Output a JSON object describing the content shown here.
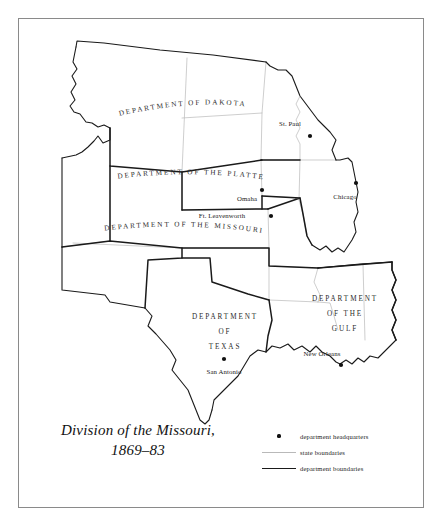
{
  "figure": {
    "title_lines": [
      "Division of the Missouri,",
      "1869–83"
    ],
    "frame_color": "#8a8a8a",
    "background": "#ffffff"
  },
  "map": {
    "departments": [
      {
        "id": "dakota",
        "label_lines": [
          "DEPARTMENT",
          "OF  DAKOTA"
        ],
        "full_name": "DEPARTMENT OF DAKOTA",
        "layout": "arc-single-line"
      },
      {
        "id": "platte",
        "label_lines": [
          "DEPARTMENT",
          "OF  THE  PLATTE"
        ],
        "full_name": "DEPARTMENT OF THE PLATTE",
        "layout": "arc-single-line"
      },
      {
        "id": "missouri",
        "label_lines": [
          "DEPARTMENT",
          "OF  THE  MISSOURI"
        ],
        "full_name": "DEPARTMENT OF THE MISSOURI",
        "layout": "arc-single-line"
      },
      {
        "id": "texas",
        "label_lines": [
          "DEPARTMENT",
          "OF",
          "TEXAS"
        ],
        "full_name": "DEPARTMENT OF TEXAS",
        "layout": "stacked-centered"
      },
      {
        "id": "gulf",
        "label_lines": [
          "DEPARTMENT",
          "OF THE",
          "GULF"
        ],
        "full_name": "DEPARTMENT OF THE GULF",
        "layout": "stacked-centered"
      }
    ],
    "headquarters": [
      {
        "id": "st-paul",
        "name": "St. Paul",
        "label_x": 290,
        "label_y": 126,
        "dot_x": 310,
        "dot_y": 136
      },
      {
        "id": "chicago",
        "name": "Chicago",
        "label_x": 345,
        "label_y": 199,
        "dot_x": 356,
        "dot_y": 183
      },
      {
        "id": "omaha",
        "name": "Omaha",
        "label_x": 248,
        "label_y": 200,
        "dot_x": 261,
        "dot_y": 190
      },
      {
        "id": "ft-leavenworth",
        "name": "Ft. Leavenworth",
        "label_x": 222,
        "label_y": 216,
        "dot_x": 271,
        "dot_y": 216
      },
      {
        "id": "san-antonio",
        "name": "San Antonio",
        "label_x": 206,
        "label_y": 372,
        "dot_x": 222,
        "dot_y": 359
      },
      {
        "id": "new-orleans",
        "name": "New Orleans",
        "label_x": 323,
        "label_y": 355,
        "dot_x": 340,
        "dot_y": 364
      }
    ],
    "line_styles": {
      "department_boundary_color": "#1a1a1a",
      "department_boundary_width": 1.5,
      "state_boundary_color": "#b9b9b9",
      "state_boundary_width": 0.7,
      "headquarters_dot_color": "#111111"
    }
  },
  "legend": {
    "items": [
      {
        "key": "dot",
        "label": "department headquarters"
      },
      {
        "key": "thin-line",
        "label": "state boundaries"
      },
      {
        "key": "thick-line",
        "label": "department boundaries"
      }
    ]
  }
}
